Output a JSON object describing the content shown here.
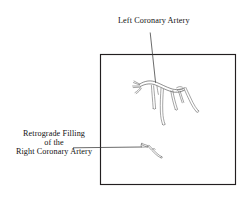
{
  "figure": {
    "title_context": "Coronary angiogram line drawing",
    "background_color": "#ffffff",
    "frame": {
      "name": "image-frame",
      "x": 100,
      "y": 54,
      "width": 136,
      "height": 131,
      "stroke_color": "#231f20"
    },
    "labels": {
      "left_coronary": {
        "text": "Left Coronary Artery",
        "x": 118,
        "y": 17,
        "font_size_px": 8.2,
        "color": "#111111"
      },
      "retrograde": {
        "line1": "Retrograde Filling",
        "line2": "of the",
        "line3": "Right Coronary Artery",
        "x": 6,
        "y": 130,
        "font_size_px": 8.2,
        "color": "#111111"
      }
    },
    "leaders": [
      {
        "name": "leader-left-coronary",
        "from": [
          150,
          32
        ],
        "to": [
          156,
          83
        ],
        "color": "#3a3a3a"
      },
      {
        "name": "leader-retrograde",
        "from": [
          73,
          148
        ],
        "to": [
          141,
          147
        ],
        "color": "#3a3a3a"
      }
    ],
    "drawings": {
      "left_coronary_tree": {
        "name": "left-coronary-artery-drawing",
        "stroke_color": "#4a4a4a",
        "description": "branching coronary tree drawn as thin double outline vessels"
      },
      "right_coronary_retrograde": {
        "name": "right-coronary-artery-drawing",
        "stroke_color": "#4a4a4a",
        "description": "small hooked vessel segment indicating retrograde filling"
      }
    }
  }
}
